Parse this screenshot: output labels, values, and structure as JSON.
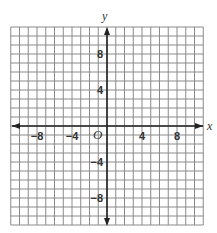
{
  "chart_data": {
    "type": "coordinate-grid",
    "title": "",
    "xlabel": "x",
    "ylabel": "y",
    "origin_label": "O",
    "xlim": [
      -11,
      11
    ],
    "ylim": [
      -11,
      11
    ],
    "grid": true,
    "grid_step": 1,
    "x_tick_labels": [
      {
        "value": -8,
        "label": "−8"
      },
      {
        "value": -4,
        "label": "−4"
      },
      {
        "value": 4,
        "label": "4"
      },
      {
        "value": 8,
        "label": "8"
      }
    ],
    "y_tick_labels": [
      {
        "value": 8,
        "label": "8"
      },
      {
        "value": 4,
        "label": "4"
      },
      {
        "value": -4,
        "label": "−4"
      },
      {
        "value": -8,
        "label": "−8"
      }
    ],
    "series": []
  },
  "colors": {
    "grid": "#8a8a8a",
    "axis": "#222222",
    "text": "#333333"
  }
}
